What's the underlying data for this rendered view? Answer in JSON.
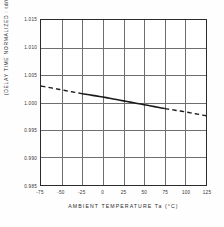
{
  "chart_data": {
    "type": "line",
    "title": "",
    "xlabel": "AMBIENT  TEMPERATURE  Ta (°C)",
    "ylabel": "(DELAY TIME  NORMALIZED : td/tn)",
    "xlim": [
      -75,
      125
    ],
    "ylim": [
      0.985,
      1.015
    ],
    "xticks": [
      -75,
      -50,
      -25,
      0,
      25,
      50,
      75,
      100,
      125
    ],
    "xtick_labels": [
      "-75",
      "-50",
      "-25",
      "0",
      "25",
      "50",
      "75",
      "100",
      "125"
    ],
    "yticks": [
      0.985,
      0.99,
      0.995,
      1.0,
      1.005,
      1.01,
      1.015
    ],
    "ytick_labels": [
      "0.985",
      "0.990",
      "0.995",
      "1.000",
      "1.005",
      "1.010",
      "1.015"
    ],
    "grid": true,
    "legend": null,
    "line_color": "#1a1a1a",
    "series": [
      {
        "name": "delay time normalized",
        "style": "dashed-extrapolated-solid-measured",
        "x": [
          -75,
          -50,
          -25,
          0,
          25,
          50,
          75,
          100,
          125
        ],
        "values": [
          1.003,
          1.0023,
          1.0016,
          1.001,
          1.0003,
          0.9996,
          0.9989,
          0.9983,
          0.9976
        ],
        "solid_range": [
          -25,
          75
        ],
        "dashed_ranges": [
          [
            -75,
            -25
          ],
          [
            75,
            125
          ]
        ]
      }
    ]
  },
  "axes": {
    "ytick_labels": [
      "1.015",
      "1.010",
      "1.005",
      "1.000",
      "0.995",
      "0.990",
      "0.985"
    ],
    "xtick_labels": [
      "-75",
      "-50",
      "-25",
      "0",
      "25",
      "50",
      "75",
      "100",
      "125"
    ],
    "xlabel": "AMBIENT  TEMPERATURE  Ta (°C)",
    "ylabel": "(DELAY TIME  NORMALIZED : td/tn)"
  },
  "colors": {
    "background": "#fefefe",
    "plot_background": "#ffffff",
    "frame": "#2b2b2b",
    "grid": "#6e6e6e",
    "data": "#1a1a1a",
    "text": "#2b2b2b"
  }
}
